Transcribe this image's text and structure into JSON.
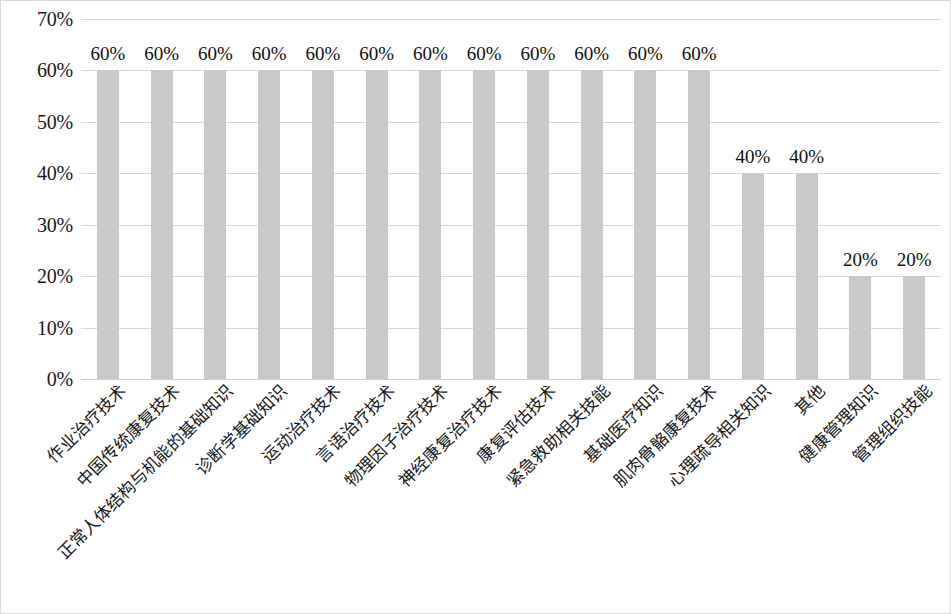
{
  "chart_data": {
    "type": "bar",
    "title": "",
    "subtitle": "",
    "xlabel": "",
    "ylabel": "",
    "ylim": [
      0,
      70
    ],
    "ytick_labels": [
      "70%",
      "60%",
      "50%",
      "40%",
      "30%",
      "20%",
      "10%",
      "0%"
    ],
    "ytick_values": [
      70,
      60,
      50,
      40,
      30,
      20,
      10,
      0
    ],
    "grid": true,
    "legend": false,
    "legend_position": "none",
    "bar_color": "#c9c9c9",
    "gridline_color": "#d9d9d9",
    "categories": [
      "作业治疗技术",
      "中国传统康复技术",
      "正常人体结构与机能的基础知识",
      "诊断学基础知识",
      "运动治疗技术",
      "言语治疗技术",
      "物理因子治疗技术",
      "神经康复治疗技术",
      "康复评估技术",
      "紧急救助相关技能",
      "基础医疗知识",
      "肌肉骨骼康复技术",
      "心理疏导相关知识",
      "其他",
      "健康管理知识",
      "管理组织技能"
    ],
    "values": [
      60,
      60,
      60,
      60,
      60,
      60,
      60,
      60,
      60,
      60,
      60,
      60,
      40,
      40,
      20,
      20
    ],
    "value_labels": [
      "60%",
      "60%",
      "60%",
      "60%",
      "60%",
      "60%",
      "60%",
      "60%",
      "60%",
      "60%",
      "60%",
      "60%",
      "40%",
      "40%",
      "20%",
      "20%"
    ]
  }
}
